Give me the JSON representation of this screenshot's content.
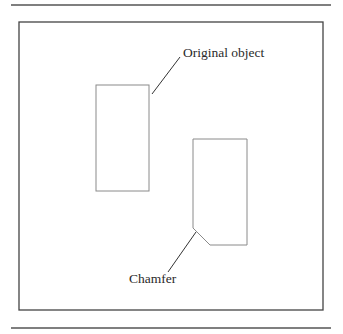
{
  "figure": {
    "labels": {
      "original_object": "Original object",
      "chamfer": "Chamfer"
    },
    "colors": {
      "rule": "#555555",
      "frame": "#444444",
      "shape": "#8a8a8a",
      "leader": "#333333",
      "text": "#2a2a2a"
    },
    "shapes": [
      {
        "name": "original-rectangle",
        "type": "rectangle",
        "x": 96,
        "y": 85,
        "width": 53,
        "height": 106
      },
      {
        "name": "chamfered-rectangle",
        "type": "polygon",
        "points": "193,139 247,139 247,245 210,245 193,228"
      }
    ]
  }
}
